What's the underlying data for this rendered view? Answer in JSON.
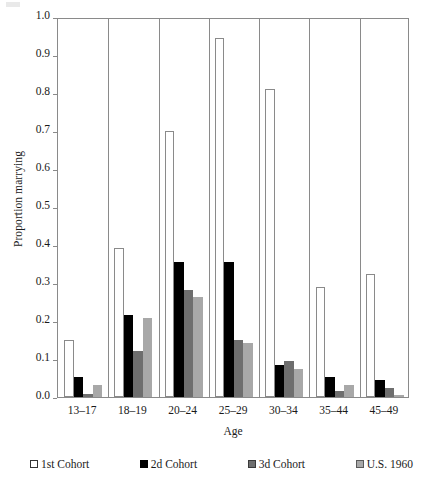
{
  "chart_data": {
    "type": "bar",
    "title": "",
    "xlabel": "Age",
    "ylabel": "Proportion marrying",
    "ylim": [
      0.0,
      1.0
    ],
    "ytick_labels": [
      "0.0",
      "0.1",
      "0.2",
      "0.3",
      "0.4",
      "0.5",
      "0.6",
      "0.7",
      "0.8",
      "0.9",
      "1.0"
    ],
    "ytick_values": [
      0.0,
      0.1,
      0.2,
      0.3,
      0.4,
      0.5,
      0.6,
      0.7,
      0.8,
      0.9,
      1.0
    ],
    "categories": [
      "13–17",
      "18–19",
      "20–24",
      "25–29",
      "30–34",
      "35–44",
      "45–49"
    ],
    "grid": false,
    "legend_position": "bottom",
    "series": [
      {
        "name": "1st Cohort",
        "color": "#ffffff",
        "values": [
          0.151,
          0.393,
          0.699,
          0.945,
          0.81,
          0.289,
          0.325
        ]
      },
      {
        "name": "2d Cohort",
        "color": "#000000",
        "values": [
          0.053,
          0.216,
          0.354,
          0.356,
          0.083,
          0.053,
          0.045
        ]
      },
      {
        "name": "3d Cohort",
        "color": "#6e6e6e",
        "values": [
          0.008,
          0.12,
          0.281,
          0.151,
          0.095,
          0.016,
          0.025
        ]
      },
      {
        "name": "U.S. 1960",
        "color": "#a8a8a8",
        "values": [
          0.032,
          0.209,
          0.264,
          0.141,
          0.075,
          0.032,
          0.005
        ]
      }
    ]
  },
  "axes": {
    "y_title": "Proportion marrying",
    "x_title": "Age"
  },
  "legend": {
    "items": [
      {
        "label": "1st Cohort",
        "swatch": "legend-swatch-open-square"
      },
      {
        "label": "2d Cohort",
        "swatch": "legend-swatch-filled-square"
      },
      {
        "label": "3d Cohort",
        "swatch": "legend-swatch-dark-gray-square"
      },
      {
        "label": "U.S. 1960",
        "swatch": "legend-swatch-light-gray-square"
      }
    ]
  }
}
